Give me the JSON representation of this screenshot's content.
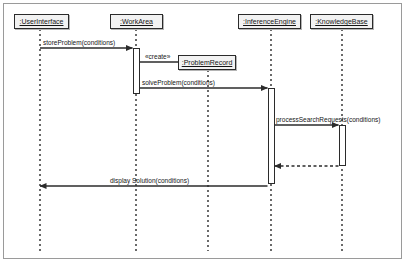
{
  "diagram": {
    "type": "uml-sequence-diagram",
    "title": "",
    "width": 406,
    "height": 263,
    "border_color": "#9a9a9a",
    "line_color": "#2b2b2b",
    "background": "#ffffff"
  },
  "lifelines": [
    {
      "id": "userinterface",
      "label": ":UserInterface",
      "x": 40,
      "box_left": 14,
      "box_width": 55,
      "box_top": 14,
      "created": false
    },
    {
      "id": "workarea",
      "label": ":WorkArea",
      "x": 136,
      "box_left": 110,
      "box_width": 53,
      "box_top": 14,
      "created": false
    },
    {
      "id": "problemrecord",
      "label": ":ProblemRecord",
      "x": 208,
      "box_left": 178,
      "box_width": 58,
      "box_top": 55,
      "created": true
    },
    {
      "id": "inferenceengine",
      "label": ":InferenceEngine",
      "x": 271,
      "box_left": 238,
      "box_width": 63,
      "box_top": 14,
      "created": false
    },
    {
      "id": "knowledgebase",
      "label": ":KnowledgeBase",
      "x": 342,
      "box_left": 310,
      "box_width": 63,
      "box_top": 14,
      "created": false
    }
  ],
  "activations": [
    {
      "id": "act-workarea",
      "lifeline": "workarea",
      "top": 48,
      "height": 46
    },
    {
      "id": "act-inferenceengine",
      "lifeline": "inferenceengine",
      "top": 88,
      "height": 96
    },
    {
      "id": "act-knowledgebase",
      "lifeline": "knowledgebase",
      "top": 125,
      "height": 41
    }
  ],
  "messages": [
    {
      "id": "msg-storeproblem",
      "label": "storeProblem(conditions)",
      "from": "userinterface",
      "to": "workarea",
      "y": 48,
      "style": "solid",
      "direction": "right",
      "label_x": 43,
      "label_y": 39
    },
    {
      "id": "msg-create",
      "label": "«create»",
      "from": "workarea",
      "to": "problemrecord",
      "y": 62,
      "style": "solid",
      "direction": "right",
      "label_x": 145,
      "label_y": 53
    },
    {
      "id": "msg-solveproblem",
      "label": "solveProblem(conditions)",
      "from": "workarea",
      "to": "inferenceengine",
      "y": 88,
      "style": "solid",
      "direction": "right",
      "label_x": 142,
      "label_y": 79
    },
    {
      "id": "msg-processsearchrequests",
      "label": "processSearchRequests(conditions)",
      "from": "inferenceengine",
      "to": "knowledgebase",
      "y": 125,
      "style": "solid",
      "direction": "right",
      "label_x": 276,
      "label_y": 116
    },
    {
      "id": "msg-searchreturn",
      "label": "",
      "from": "knowledgebase",
      "to": "inferenceengine",
      "y": 166,
      "style": "dashed",
      "direction": "left",
      "label_x": 0,
      "label_y": 0
    },
    {
      "id": "msg-displaysolution",
      "label": "display Solution(conditions)",
      "from": "inferenceengine",
      "to": "userinterface",
      "y": 186,
      "style": "solid",
      "direction": "left",
      "label_x": 110,
      "label_y": 177
    }
  ]
}
